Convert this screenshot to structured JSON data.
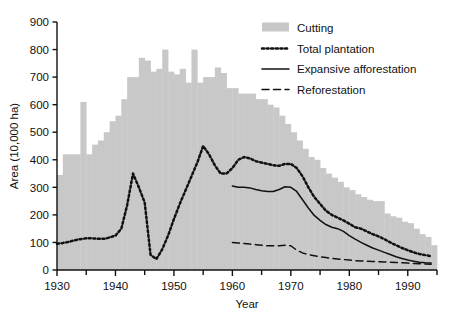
{
  "chart_data": {
    "type": "bar",
    "title": "",
    "xlabel": "Year",
    "ylabel": "Area (10,000 ha)",
    "xlim": [
      1930,
      1995
    ],
    "ylim": [
      0,
      900
    ],
    "ytick_step": 100,
    "xtick_major_step": 10,
    "xtick_minor_step": 5,
    "grid": false,
    "legend_position": "top-right",
    "ytick_labels": [
      "0",
      "100",
      "200",
      "300",
      "400",
      "500",
      "600",
      "700",
      "800",
      "900"
    ],
    "xtick_labels": [
      "1930",
      "1940",
      "1950",
      "1960",
      "1970",
      "1980",
      "1990"
    ],
    "colors": {
      "bar_fill": "#c8c8c8",
      "line": "#111111",
      "axis": "#111111"
    },
    "series": [
      {
        "name": "Cutting",
        "marker": "bar",
        "x": [
          1930,
          1931,
          1932,
          1933,
          1934,
          1935,
          1936,
          1937,
          1938,
          1939,
          1940,
          1941,
          1942,
          1943,
          1944,
          1945,
          1946,
          1947,
          1948,
          1949,
          1950,
          1951,
          1952,
          1953,
          1954,
          1955,
          1956,
          1957,
          1958,
          1959,
          1960,
          1961,
          1962,
          1963,
          1964,
          1965,
          1966,
          1967,
          1968,
          1969,
          1970,
          1971,
          1972,
          1973,
          1974,
          1975,
          1976,
          1977,
          1978,
          1979,
          1980,
          1981,
          1982,
          1983,
          1984,
          1985,
          1986,
          1987,
          1988,
          1989,
          1990,
          1991,
          1992,
          1993,
          1994
        ],
        "values": [
          345,
          420,
          420,
          420,
          610,
          420,
          455,
          470,
          500,
          540,
          560,
          620,
          700,
          700,
          770,
          760,
          720,
          730,
          800,
          720,
          710,
          730,
          680,
          800,
          680,
          700,
          700,
          735,
          715,
          660,
          660,
          640,
          640,
          640,
          620,
          620,
          600,
          590,
          560,
          530,
          500,
          470,
          440,
          410,
          400,
          370,
          350,
          335,
          320,
          300,
          290,
          275,
          265,
          255,
          250,
          250,
          205,
          195,
          190,
          175,
          170,
          150,
          130,
          120,
          90
        ]
      },
      {
        "name": "Total plantation",
        "marker": "dotted",
        "x": [
          1930,
          1931,
          1932,
          1933,
          1934,
          1935,
          1936,
          1937,
          1938,
          1939,
          1940,
          1941,
          1942,
          1943,
          1944,
          1945,
          1946,
          1947,
          1948,
          1949,
          1950,
          1951,
          1952,
          1953,
          1954,
          1955,
          1956,
          1957,
          1958,
          1959,
          1960,
          1961,
          1962,
          1963,
          1964,
          1965,
          1966,
          1967,
          1968,
          1969,
          1970,
          1971,
          1972,
          1973,
          1974,
          1975,
          1976,
          1977,
          1978,
          1979,
          1980,
          1981,
          1982,
          1983,
          1984,
          1985,
          1986,
          1987,
          1988,
          1989,
          1990,
          1991,
          1992,
          1993,
          1994
        ],
        "values": [
          95,
          98,
          102,
          108,
          112,
          115,
          115,
          113,
          113,
          118,
          125,
          150,
          235,
          350,
          300,
          245,
          55,
          40,
          75,
          125,
          185,
          240,
          290,
          340,
          390,
          450,
          420,
          380,
          350,
          350,
          370,
          400,
          410,
          405,
          395,
          390,
          385,
          380,
          378,
          385,
          385,
          370,
          340,
          300,
          265,
          240,
          215,
          200,
          190,
          180,
          168,
          155,
          150,
          140,
          130,
          122,
          112,
          100,
          90,
          80,
          72,
          64,
          58,
          54,
          50
        ]
      },
      {
        "name": "Expansive afforestation",
        "marker": "solid",
        "x": [
          1960,
          1961,
          1962,
          1963,
          1964,
          1965,
          1966,
          1967,
          1968,
          1969,
          1970,
          1971,
          1972,
          1973,
          1974,
          1975,
          1976,
          1977,
          1978,
          1979,
          1980,
          1981,
          1982,
          1983,
          1984,
          1985,
          1986,
          1987,
          1988,
          1989,
          1990,
          1991,
          1992,
          1993,
          1994
        ],
        "values": [
          305,
          300,
          300,
          298,
          292,
          288,
          285,
          285,
          292,
          302,
          300,
          285,
          255,
          225,
          198,
          180,
          165,
          155,
          150,
          140,
          125,
          112,
          100,
          90,
          80,
          72,
          64,
          56,
          48,
          42,
          36,
          32,
          28,
          26,
          25
        ]
      },
      {
        "name": "Reforestation",
        "marker": "dashed",
        "x": [
          1960,
          1961,
          1962,
          1963,
          1964,
          1965,
          1966,
          1967,
          1968,
          1969,
          1970,
          1971,
          1972,
          1973,
          1974,
          1975,
          1976,
          1977,
          1978,
          1979,
          1980,
          1981,
          1982,
          1983,
          1984,
          1985,
          1986,
          1987,
          1988,
          1989,
          1990,
          1991,
          1992,
          1993,
          1994
        ],
        "values": [
          100,
          98,
          96,
          94,
          92,
          90,
          88,
          88,
          88,
          90,
          88,
          72,
          62,
          56,
          52,
          48,
          45,
          42,
          40,
          38,
          36,
          34,
          33,
          32,
          31,
          30,
          29,
          28,
          27,
          26,
          25,
          24,
          23,
          22,
          21
        ]
      }
    ],
    "legend": [
      {
        "label": "Cutting",
        "style": "bar"
      },
      {
        "label": "Total plantation",
        "style": "dotted"
      },
      {
        "label": "Expansive afforestation",
        "style": "solid"
      },
      {
        "label": "Reforestation",
        "style": "dashed"
      }
    ]
  }
}
